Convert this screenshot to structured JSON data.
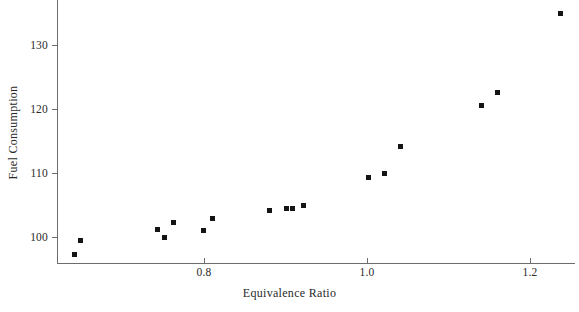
{
  "chart_data": {
    "type": "scatter",
    "title": "",
    "xlabel": "Equivalence Ratio",
    "ylabel": "Fuel Consumption",
    "xlim": [
      0.62,
      1.255
    ],
    "ylim": [
      96.1,
      137.3
    ],
    "grid": false,
    "legend": null,
    "xticks": [
      0.8,
      1.0,
      1.2
    ],
    "xtick_labels": [
      "0.8",
      "1.0",
      "1.2"
    ],
    "yticks": [
      100,
      110,
      120,
      130
    ],
    "ytick_labels": [
      "100",
      "110",
      "120",
      "130"
    ],
    "marker": "square",
    "marker_color": "#141414",
    "points": [
      {
        "x": 0.641,
        "y": 97.3
      },
      {
        "x": 0.649,
        "y": 99.4
      },
      {
        "x": 0.743,
        "y": 101.2
      },
      {
        "x": 0.752,
        "y": 100.0
      },
      {
        "x": 0.763,
        "y": 102.3
      },
      {
        "x": 0.799,
        "y": 101.0
      },
      {
        "x": 0.81,
        "y": 102.9
      },
      {
        "x": 0.88,
        "y": 104.1
      },
      {
        "x": 0.901,
        "y": 104.5
      },
      {
        "x": 0.909,
        "y": 104.5
      },
      {
        "x": 0.922,
        "y": 104.9
      },
      {
        "x": 1.002,
        "y": 109.3
      },
      {
        "x": 1.022,
        "y": 109.9
      },
      {
        "x": 1.041,
        "y": 114.2
      },
      {
        "x": 1.14,
        "y": 120.6
      },
      {
        "x": 1.16,
        "y": 122.6
      },
      {
        "x": 1.238,
        "y": 135.0
      }
    ]
  }
}
